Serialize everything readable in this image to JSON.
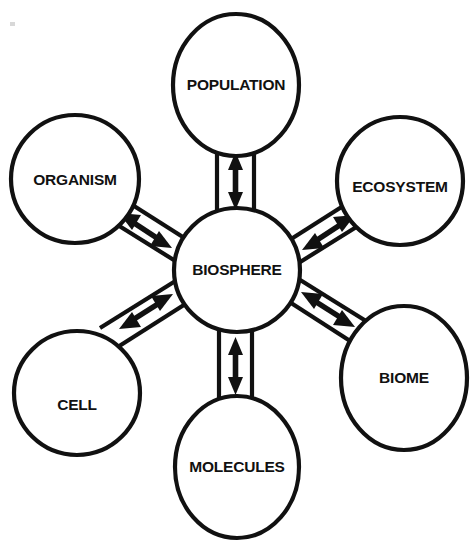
{
  "diagram": {
    "type": "hub-and-spoke",
    "background_color": "#ffffff",
    "stroke_color": "#111111",
    "center": {
      "id": "biosphere",
      "label": "BIOSPHERE",
      "cx": 237,
      "cy": 270,
      "rx": 63,
      "ry": 62
    },
    "nodes": [
      {
        "id": "population",
        "label": "POPULATION",
        "cx": 236,
        "cy": 85,
        "rx": 63,
        "ry": 71,
        "position": "top"
      },
      {
        "id": "ecosystem",
        "label": "ECOSYSTEM",
        "cx": 400,
        "cy": 181,
        "rx": 63,
        "ry": 64,
        "position": "top-right"
      },
      {
        "id": "biome",
        "label": "BIOME",
        "cx": 404,
        "cy": 378,
        "rx": 63,
        "ry": 72,
        "position": "bottom-right"
      },
      {
        "id": "molecules",
        "label": "MOLECULES",
        "cx": 237,
        "cy": 467,
        "rx": 62,
        "ry": 71,
        "position": "bottom"
      },
      {
        "id": "cell",
        "label": "CELL",
        "cx": 77,
        "cy": 393,
        "rx": 63,
        "ry": 62,
        "position": "bottom-left"
      },
      {
        "id": "organism",
        "label": "ORGANISM",
        "cx": 75,
        "cy": 179,
        "rx": 64,
        "ry": 64,
        "position": "top-left"
      }
    ],
    "connectors": [
      {
        "id": "biosphere-population",
        "from": "biosphere",
        "to": "population",
        "arrow": "double",
        "style": "channel"
      },
      {
        "id": "biosphere-ecosystem",
        "from": "biosphere",
        "to": "ecosystem",
        "arrow": "double",
        "style": "channel"
      },
      {
        "id": "biosphere-biome",
        "from": "biosphere",
        "to": "biome",
        "arrow": "double",
        "style": "channel"
      },
      {
        "id": "biosphere-molecules",
        "from": "biosphere",
        "to": "molecules",
        "arrow": "double",
        "style": "channel"
      },
      {
        "id": "biosphere-cell",
        "from": "biosphere",
        "to": "cell",
        "arrow": "double",
        "style": "channel"
      },
      {
        "id": "biosphere-organism",
        "from": "biosphere",
        "to": "organism",
        "arrow": "double",
        "style": "channel"
      }
    ]
  }
}
